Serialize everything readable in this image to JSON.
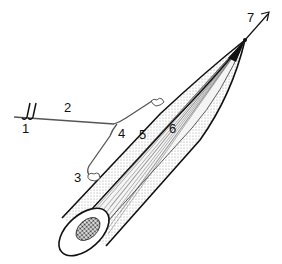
{
  "diagram": {
    "labels": {
      "l1": "1",
      "l2": "2",
      "l3": "3",
      "l4": "4",
      "l5": "5",
      "l6": "6",
      "l7": "7"
    },
    "colors": {
      "line": "#111111",
      "background": "#ffffff",
      "stipple": "#bdbdbd",
      "core": "#333333"
    }
  }
}
